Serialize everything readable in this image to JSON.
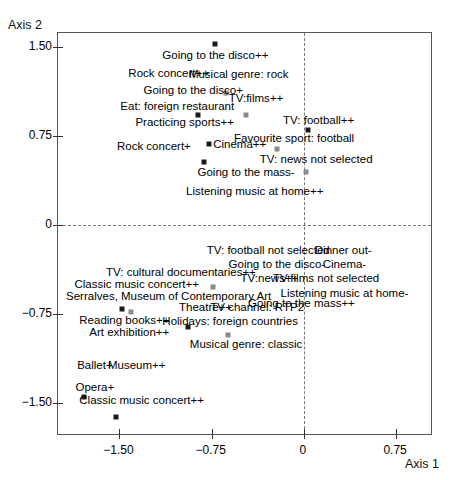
{
  "chart_data": {
    "type": "scatter",
    "title": "",
    "xlabel": "Axis 1",
    "ylabel": "Axis 2",
    "xlim": [
      -2.0,
      1.05
    ],
    "ylim": [
      -1.78,
      1.62
    ],
    "xticks": [
      -1.5,
      -0.75,
      0,
      0.75
    ],
    "xtick_labels": [
      "−1.50",
      "−0.75",
      "0",
      "0.75"
    ],
    "yticks": [
      1.5,
      0.75,
      0,
      -0.75,
      -1.5
    ],
    "ytick_labels": [
      "1.50",
      "0.75",
      "0",
      "−0.75",
      "−1.50"
    ],
    "grid": false,
    "reference_lines": {
      "vertical_x": 0,
      "horizontal_y": 0
    },
    "legend": "none",
    "points": [
      {
        "label": "Going to the disco++",
        "x": -0.72,
        "y": 1.53,
        "label_pos": "below",
        "marker": "dark"
      },
      {
        "label": "Rock concert++",
        "x": -1.1,
        "y": 1.28,
        "label_pos": "label-only",
        "marker": "none"
      },
      {
        "label": "Musical genre: rock",
        "x": -0.53,
        "y": 1.27,
        "label_pos": "label-only",
        "marker": "none"
      },
      {
        "label": "Going to the disco+",
        "x": -0.9,
        "y": 1.14,
        "label_pos": "label-only",
        "marker": "none"
      },
      {
        "label": "musical-rock-marker",
        "x": -0.63,
        "y": 1.11,
        "label_pos": "marker-only",
        "marker": "light"
      },
      {
        "label": "TV:films++",
        "x": -0.39,
        "y": 1.07,
        "label_pos": "label-only",
        "marker": "none"
      },
      {
        "label": "Eat: foreign restaurant",
        "x": -1.03,
        "y": 1.0,
        "label_pos": "label-only",
        "marker": "none"
      },
      {
        "label": "eat-foreign-marker",
        "x": -0.86,
        "y": 0.93,
        "label_pos": "marker-only",
        "marker": "dark"
      },
      {
        "label": "tvfilms-marker",
        "x": -0.47,
        "y": 0.93,
        "label_pos": "marker-only",
        "marker": "light"
      },
      {
        "label": "Practicing sports++",
        "x": -0.97,
        "y": 0.87,
        "label_pos": "label-only",
        "marker": "none"
      },
      {
        "label": "TV: football++",
        "x": 0.12,
        "y": 0.89,
        "label_pos": "label-only",
        "marker": "none"
      },
      {
        "label": "tv-football-marker",
        "x": 0.03,
        "y": 0.8,
        "label_pos": "marker-only",
        "marker": "dark"
      },
      {
        "label": "Favourite sport: football",
        "x": -0.08,
        "y": 0.73,
        "label_pos": "label-only",
        "marker": "none"
      },
      {
        "label": "Rock concert+",
        "x": -1.22,
        "y": 0.67,
        "label_pos": "label-only",
        "marker": "none"
      },
      {
        "label": "Cinema++",
        "x": -0.77,
        "y": 0.68,
        "label_pos": "right",
        "marker": "dark"
      },
      {
        "label": "fav-sport-marker",
        "x": -0.22,
        "y": 0.64,
        "label_pos": "marker-only",
        "marker": "light"
      },
      {
        "label": "TV: news not selected",
        "x": 0.1,
        "y": 0.56,
        "label_pos": "label-only",
        "marker": "none"
      },
      {
        "label": "Going to the mass-",
        "x": -0.47,
        "y": 0.45,
        "label_pos": "label-only",
        "marker": "none"
      },
      {
        "label": "going-mass-marker",
        "x": -0.81,
        "y": 0.53,
        "label_pos": "marker-only",
        "marker": "dark"
      },
      {
        "label": "tv-news-marker",
        "x": 0.02,
        "y": 0.45,
        "label_pos": "marker-only",
        "marker": "light"
      },
      {
        "label": "Listening music at home++",
        "x": -0.4,
        "y": 0.29,
        "label_pos": "label-only",
        "marker": "none"
      },
      {
        "label": "TV: football not selected",
        "x": -0.29,
        "y": -0.21,
        "label_pos": "label-only",
        "marker": "none"
      },
      {
        "label": "Dinner out-",
        "x": 0.32,
        "y": -0.21,
        "label_pos": "label-only",
        "marker": "none"
      },
      {
        "label": "Going to the disco-",
        "x": -0.22,
        "y": -0.33,
        "label_pos": "label-only",
        "marker": "none"
      },
      {
        "label": "Cinema-",
        "x": 0.33,
        "y": -0.33,
        "label_pos": "label-only",
        "marker": "none"
      },
      {
        "label": "TV: cultural documentaries++",
        "x": -1.0,
        "y": -0.4,
        "label_pos": "label-only",
        "marker": "none"
      },
      {
        "label": "TV:news++",
        "x": -0.28,
        "y": -0.45,
        "label_pos": "label-only",
        "marker": "none"
      },
      {
        "label": "TV:films not selected",
        "x": 0.18,
        "y": -0.45,
        "label_pos": "label-only",
        "marker": "none"
      },
      {
        "label": "Classic music concert++",
        "x": -1.36,
        "y": -0.5,
        "label_pos": "label-only",
        "marker": "none"
      },
      {
        "label": "cultural-doc-marker",
        "x": -0.74,
        "y": -0.52,
        "label_pos": "marker-only",
        "marker": "light"
      },
      {
        "label": "Listening music at home-",
        "x": 0.33,
        "y": -0.57,
        "label_pos": "label-only",
        "marker": "none"
      },
      {
        "label": "Serralves, Museum of Contemporary Art",
        "x": -1.1,
        "y": -0.6,
        "label_pos": "label-only",
        "marker": "none"
      },
      {
        "label": "Going to the mass++",
        "x": -0.02,
        "y": -0.66,
        "label_pos": "label-only",
        "marker": "none"
      },
      {
        "label": "Theatre++",
        "x": -0.8,
        "y": -0.69,
        "label_pos": "label-only",
        "marker": "none"
      },
      {
        "label": "TV channel: RTP2",
        "x": -0.38,
        "y": -0.69,
        "label_pos": "label-only",
        "marker": "none"
      },
      {
        "label": "reading-books-marker-a",
        "x": -1.48,
        "y": -0.71,
        "label_pos": "marker-only",
        "marker": "dark"
      },
      {
        "label": "reading-books-marker-b",
        "x": -1.41,
        "y": -0.73,
        "label_pos": "marker-only",
        "marker": "light"
      },
      {
        "label": "Reading books++",
        "x": -1.46,
        "y": -0.8,
        "label_pos": "label-only",
        "marker": "none"
      },
      {
        "label": "Holidays: foreign countries",
        "x": -0.6,
        "y": -0.81,
        "label_pos": "label-only",
        "marker": "none"
      },
      {
        "label": "holidays-marker",
        "x": -0.94,
        "y": -0.86,
        "label_pos": "marker-only",
        "marker": "dark"
      },
      {
        "label": "Art exhibition++",
        "x": -1.42,
        "y": -0.9,
        "label_pos": "label-only",
        "marker": "none"
      },
      {
        "label": "musical-classic-marker",
        "x": -0.62,
        "y": -0.93,
        "label_pos": "marker-only",
        "marker": "light"
      },
      {
        "label": "Musical genre: classic",
        "x": -0.47,
        "y": -1.0,
        "label_pos": "label-only",
        "marker": "none"
      },
      {
        "label": "Ballet+",
        "x": -1.7,
        "y": -1.18,
        "label_pos": "label-only",
        "marker": "none"
      },
      {
        "label": "Museum++",
        "x": -1.36,
        "y": -1.18,
        "label_pos": "label-only",
        "marker": "none"
      },
      {
        "label": "Opera+",
        "x": -1.7,
        "y": -1.37,
        "label_pos": "label-only",
        "marker": "none"
      },
      {
        "label": "opera-marker",
        "x": -1.79,
        "y": -1.45,
        "label_pos": "marker-only",
        "marker": "dark"
      },
      {
        "label": "Classic music concert++",
        "x": -1.32,
        "y": -1.48,
        "label_pos": "label-only",
        "marker": "none"
      },
      {
        "label": "classic-music-marker",
        "x": -1.53,
        "y": -1.62,
        "label_pos": "marker-only",
        "marker": "dark"
      }
    ]
  },
  "axes": {
    "x_title": "Axis 1",
    "y_title": "Axis 2"
  },
  "labels": {
    "p0": "Going to the disco++",
    "p1": "Rock concert++",
    "p2": "Musical genre: rock",
    "p3": "Going to the disco+",
    "p4": "TV:films++",
    "p5": "Eat: foreign restaurant",
    "p6": "Practicing sports++",
    "p7": "TV: football++",
    "p8": "Favourite sport: football",
    "p9": "Rock concert+",
    "p10": "Cinema++",
    "p11": "TV: news not selected",
    "p12": "Going to the mass-",
    "p13": "Listening music at home++",
    "p14": "TV: football not selected",
    "p15": "Dinner out-",
    "p16": "Going to the disco-",
    "p17": "Cinema-",
    "p18": "TV: cultural documentaries++",
    "p19": "TV:news++",
    "p20": "TV:films not selected",
    "p21": "Classic music concert++",
    "p22": "Listening music at home-",
    "p23": "Serralves, Museum of Contemporary Art",
    "p24": "Going to the mass++",
    "p25": "Theatre++",
    "p26": "TV channel: RTP2",
    "p27": "Reading books++",
    "p28": "Holidays: foreign countries",
    "p29": "Art exhibition++",
    "p30": "Musical genre: classic",
    "p31": "Ballet+",
    "p32": "Museum++",
    "p33": "Opera+",
    "p34": "Classic music concert++"
  },
  "ticks": {
    "y": [
      "1.50",
      "0.75",
      "0",
      "−0.75",
      "−1.50"
    ],
    "x": [
      "−1.50",
      "−0.75",
      "0",
      "0.75"
    ]
  }
}
